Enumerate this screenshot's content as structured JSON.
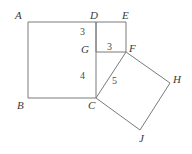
{
  "figure": {
    "type": "geometry-diagram",
    "width": 192,
    "height": 154,
    "background_color": "#ffffff",
    "stroke_color": "#7a7a7a",
    "label_color": "#3a3a3a",
    "stroke_width": 1
  },
  "points": {
    "A": {
      "label": "A",
      "x": 28,
      "y": 22,
      "label_x": 15,
      "label_y": 10
    },
    "B": {
      "label": "B",
      "x": 28,
      "y": 98,
      "label_x": 17,
      "label_y": 100
    },
    "C": {
      "label": "C",
      "x": 96,
      "y": 98,
      "label_x": 88,
      "label_y": 100
    },
    "D": {
      "label": "D",
      "x": 96,
      "y": 22,
      "label_x": 90,
      "label_y": 10
    },
    "E": {
      "label": "E",
      "x": 126,
      "y": 22,
      "label_x": 122,
      "label_y": 10
    },
    "F": {
      "label": "F",
      "x": 126,
      "y": 52,
      "label_x": 129,
      "label_y": 43
    },
    "G": {
      "label": "G",
      "x": 96,
      "y": 52,
      "label_x": 81,
      "label_y": 44
    },
    "H": {
      "label": "H",
      "x": 170,
      "y": 83,
      "label_x": 173,
      "label_y": 74
    },
    "J": {
      "label": "J",
      "x": 140,
      "y": 130,
      "label_x": 139,
      "label_y": 133
    }
  },
  "shapes": {
    "square_abcd": {
      "name": "large square ABCD",
      "vertices": "28,22 96,22 96,98 28,98"
    },
    "square_defg": {
      "name": "small square DEFG",
      "vertices": "96,22 126,22 126,52 96,52"
    },
    "square_cfhj": {
      "name": "tilted square CFHJ",
      "vertices": "96,98 126,52 170,83 140,130"
    }
  },
  "measurements": [
    {
      "label": "3",
      "segment": "DG",
      "x": 80,
      "y": 27
    },
    {
      "label": "3",
      "segment": "GF",
      "x": 107,
      "y": 42
    },
    {
      "label": "4",
      "segment": "GC",
      "x": 80,
      "y": 71
    },
    {
      "label": "5",
      "segment": "CF",
      "x": 112,
      "y": 76
    }
  ]
}
